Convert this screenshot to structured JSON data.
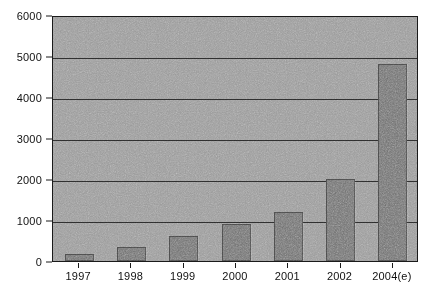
{
  "chart_data": {
    "type": "bar",
    "title": "",
    "subtitle": "",
    "xlabel": "",
    "ylabel": "",
    "categories": [
      "1997",
      "1998",
      "1999",
      "2000",
      "2001",
      "2002",
      "2004(e)"
    ],
    "values": [
      170,
      340,
      600,
      900,
      1200,
      2000,
      4800
    ],
    "series": [
      {
        "name": "",
        "values": [
          170,
          340,
          600,
          900,
          1200,
          2000,
          4800
        ]
      }
    ],
    "ylim": [
      0,
      6000
    ],
    "y_ticks": [
      "0",
      "1000",
      "2000",
      "3000",
      "4000",
      "5000",
      "6000"
    ],
    "y_tick_values": [
      0,
      1000,
      2000,
      3000,
      4000,
      5000,
      6000
    ],
    "grid": true,
    "grid_axis": "y",
    "legend": false,
    "legend_position": "none",
    "annotations": []
  },
  "style": {
    "plot_background": "#9a9a9a",
    "bar_color": "#6b6b6b",
    "grid_color": "#2b2b2b",
    "axis_color": "#1a1a1a",
    "text_color": "#111111",
    "page_background": "#ffffff"
  }
}
